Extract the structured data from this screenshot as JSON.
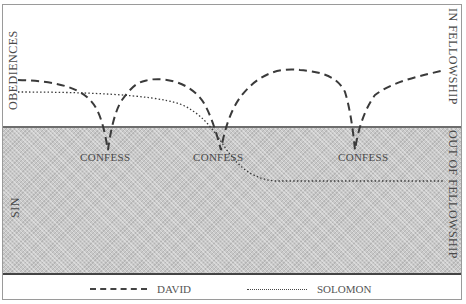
{
  "diagram": {
    "zones": {
      "upper_left_label": "OBEDIENCES",
      "upper_right_label": "IN FELLOWSHIP",
      "lower_left_label": "SIN",
      "lower_right_label": "OUT OF FELLOWSHIP"
    },
    "markers": [
      {
        "label": "CONFESS",
        "x": 82,
        "y": 150
      },
      {
        "label": "CONFESS",
        "x": 194,
        "y": 150
      },
      {
        "label": "CONFESS",
        "x": 340,
        "y": 150
      }
    ],
    "series": [
      {
        "name": "DAVID",
        "style": "dashed",
        "path": "M18,80 C60,82 88,90 95,105 C102,118 105,128 108,150 C112,128 118,100 135,90 C160,70 175,78 172,85 C185,75 205,90 215,110 C218,120 220,130 221,150 C224,120 235,95 255,80 C285,65 320,68 335,80 C348,92 352,120 355,150 C358,120 368,100 385,90 C410,80 430,76 445,70"
      },
      {
        "name": "SOLOMON",
        "style": "dotted",
        "path": "M18,92 C80,92 150,94 185,108 C205,118 215,140 225,152 C240,170 260,180 300,181 L445,181"
      }
    ],
    "colors": {
      "background": "#ffffff",
      "sin_zone": "#c9c9c9",
      "line": "#444444",
      "text": "#4a4a4a"
    }
  },
  "legend": {
    "items": [
      {
        "label": "DAVID",
        "style": "dashed"
      },
      {
        "label": "SOLOMON",
        "style": "dotted"
      }
    ]
  }
}
